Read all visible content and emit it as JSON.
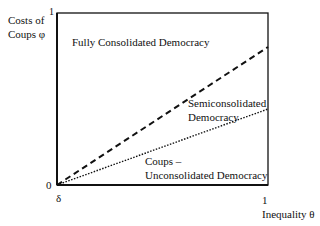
{
  "diagram": {
    "y_axis": {
      "label_line1": "Costs of",
      "label_line2": "Coups φ",
      "max_tick": "1",
      "min_tick": "0"
    },
    "x_axis": {
      "label": "Inequality θ",
      "max_tick": "1",
      "min_tick": "δ"
    },
    "regions": {
      "top": "Fully Consolidated Democracy",
      "middle_line1": "Semiconsolidated",
      "middle_line2": "Democracy",
      "bottom_line1": "Coups –",
      "bottom_line2": "Unconsolidated Democracy"
    },
    "lines": [
      {
        "name": "upper-threshold",
        "style": "dashed",
        "from": [
          0,
          0
        ],
        "to": [
          1,
          0.8
        ]
      },
      {
        "name": "lower-threshold",
        "style": "dotted",
        "from": [
          0,
          0
        ],
        "to": [
          1,
          0.44
        ]
      }
    ],
    "colors": {
      "stroke": "#111111",
      "background": "#ffffff"
    }
  }
}
